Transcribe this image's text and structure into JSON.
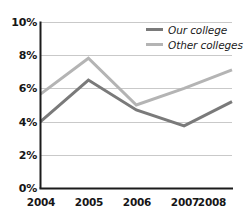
{
  "chart_data": {
    "type": "line",
    "title": "",
    "subtitle": "",
    "xlabel": "",
    "ylabel": "",
    "categories": [
      "2004",
      "2005",
      "2006",
      "2007",
      "2008"
    ],
    "x": [
      2004,
      2005,
      2006,
      2007,
      2008
    ],
    "series": [
      {
        "name": "Our college",
        "values": [
          4.0,
          6.5,
          4.7,
          3.75,
          5.2
        ],
        "color": "#7a7a7a"
      },
      {
        "name": "Other colleges",
        "values": [
          5.65,
          7.8,
          5.0,
          6.0,
          7.1
        ],
        "color": "#b4b4b4"
      }
    ],
    "ylim": [
      0,
      10
    ],
    "yticks": [
      0,
      2,
      4,
      6,
      8,
      10
    ],
    "ytick_labels": [
      "0%",
      "2%",
      "4%",
      "6%",
      "8%",
      "10%"
    ],
    "xtick_labels": [
      "2004",
      "2005",
      "2006",
      "2007",
      "2008"
    ],
    "grid": true,
    "grid_axis": "y",
    "grid_color": "#c9c9c9",
    "axis_color": "#1b1b1b",
    "legend_position": "top-right",
    "value_unit": "%"
  },
  "legend": {
    "items": [
      {
        "label": "Our college",
        "color": "#7a7a7a"
      },
      {
        "label": "Other colleges",
        "color": "#b4b4b4"
      }
    ]
  },
  "y_axis": {
    "ticks": [
      {
        "label": "10%",
        "value": 10
      },
      {
        "label": "8%",
        "value": 8
      },
      {
        "label": "6%",
        "value": 6
      },
      {
        "label": "4%",
        "value": 4
      },
      {
        "label": "2%",
        "value": 2
      },
      {
        "label": "0%",
        "value": 0
      }
    ]
  },
  "x_axis": {
    "ticks": [
      {
        "label": "2004"
      },
      {
        "label": "2005"
      },
      {
        "label": "2006"
      },
      {
        "label": "2007"
      },
      {
        "label": "2008"
      }
    ]
  }
}
